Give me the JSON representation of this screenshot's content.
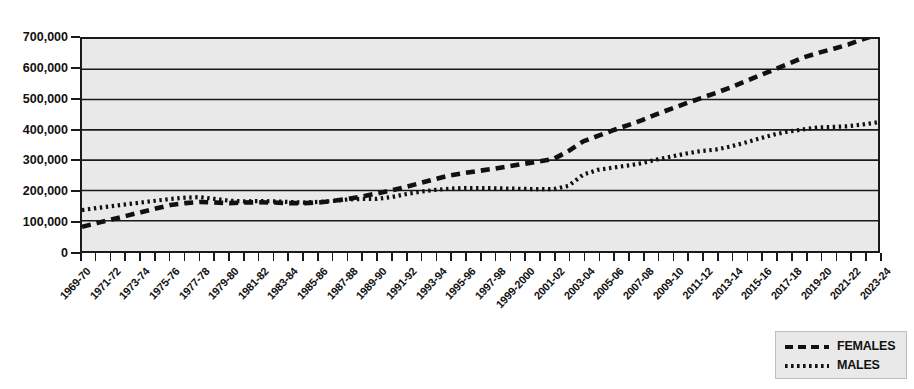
{
  "chart_data": {
    "type": "line",
    "title": "",
    "xlabel": "",
    "ylabel": "",
    "ylim": [
      0,
      700000
    ],
    "ytick_step": 100000,
    "grid": true,
    "legend_position": "bottom-right",
    "ytick_labels": [
      "700,000",
      "600,000",
      "500,000",
      "400,000",
      "300,000",
      "200,000",
      "100,000",
      "0"
    ],
    "ytick_values": [
      700000,
      600000,
      500000,
      400000,
      300000,
      200000,
      100000,
      0
    ],
    "categories": [
      "1969-70",
      "1970-71",
      "1971-72",
      "1972-73",
      "1973-74",
      "1974-75",
      "1975-76",
      "1976-77",
      "1977-78",
      "1978-79",
      "1979-80",
      "1980-81",
      "1981-82",
      "1982-83",
      "1983-84",
      "1984-85",
      "1985-86",
      "1986-87",
      "1987-88",
      "1988-89",
      "1989-90",
      "1990-91",
      "1991-92",
      "1992-93",
      "1993-94",
      "1994-95",
      "1995-96",
      "1996-97",
      "1997-98",
      "1998-99",
      "1999-2000",
      "2000-01",
      "2001-02",
      "2002-03",
      "2003-04",
      "2004-05",
      "2005-06",
      "2006-07",
      "2007-08",
      "2008-09",
      "2009-10",
      "2010-11",
      "2011-12",
      "2012-13",
      "2013-14",
      "2014-15",
      "2015-16",
      "2016-17",
      "2017-18",
      "2018-19",
      "2019-20",
      "2020-21",
      "2021-22",
      "2022-23",
      "2023-24"
    ],
    "xtick_labels_shown": [
      "1969-70",
      "1971-72",
      "1973-74",
      "1975-76",
      "1977-78",
      "1979-80",
      "1981-82",
      "1983-84",
      "1985-86",
      "1987-88",
      "1989-90",
      "1991-92",
      "1993-94",
      "1995-96",
      "1997-98",
      "1999-2000",
      "2001-02",
      "2003-04",
      "2005-06",
      "2007-08",
      "2009-10",
      "2011-12",
      "2013-14",
      "2015-16",
      "2017-18",
      "2019-20",
      "2021-22",
      "2023-24"
    ],
    "series": [
      {
        "name": "FEMALES",
        "style": "dashed",
        "color": "#111111",
        "values": [
          80000,
          92000,
          104000,
          116000,
          128000,
          140000,
          152000,
          158000,
          162000,
          160000,
          158000,
          160000,
          161000,
          160000,
          158000,
          158000,
          160000,
          165000,
          172000,
          180000,
          190000,
          200000,
          212000,
          225000,
          238000,
          250000,
          258000,
          265000,
          272000,
          280000,
          288000,
          296000,
          304000,
          330000,
          362000,
          380000,
          398000,
          415000,
          432000,
          452000,
          470000,
          488000,
          505000,
          522000,
          540000,
          560000,
          580000,
          600000,
          620000,
          640000,
          655000,
          668000,
          682000,
          700000,
          715000
        ]
      },
      {
        "name": "MALES",
        "style": "dotted",
        "color": "#111111",
        "values": [
          135000,
          142000,
          148000,
          154000,
          160000,
          166000,
          172000,
          176000,
          178000,
          172000,
          166000,
          164000,
          165000,
          164000,
          162000,
          160000,
          162000,
          165000,
          170000,
          172000,
          172000,
          178000,
          188000,
          196000,
          202000,
          206000,
          208000,
          208000,
          207000,
          206000,
          205000,
          204000,
          204000,
          215000,
          252000,
          268000,
          275000,
          282000,
          290000,
          302000,
          312000,
          322000,
          330000,
          335000,
          345000,
          358000,
          372000,
          385000,
          395000,
          402000,
          408000,
          410000,
          412000,
          418000,
          425000
        ]
      }
    ]
  },
  "legend": {
    "items": [
      {
        "label": "FEMALES",
        "key": "dashed-line-key"
      },
      {
        "label": "MALES",
        "key": "dotted-line-key"
      }
    ]
  }
}
